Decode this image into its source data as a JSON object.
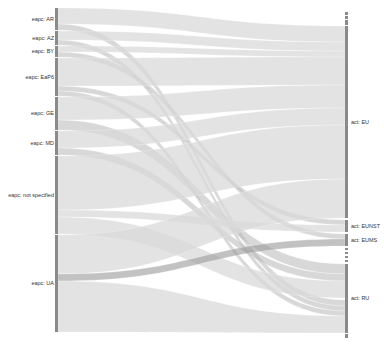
{
  "chart_data": {
    "type": "sankey",
    "title": "",
    "left_axis": {
      "x": 55,
      "width": 3
    },
    "right_axis": {
      "x": 345,
      "width": 3
    },
    "colors": {
      "node_bar": "#8a8a8a",
      "flow_light": "#d9d9d9",
      "flow_mid": "#b8b8b8",
      "flow_dark": "#9a9a9a",
      "background": "#ffffff",
      "label": "#333333"
    },
    "left_nodes": [
      {
        "label": "eapc: AR",
        "y0": 8,
        "y1": 30
      },
      {
        "label": "eapc: AZ",
        "y0": 31,
        "y1": 45
      },
      {
        "label": "eapc: BY",
        "y0": 46,
        "y1": 57
      },
      {
        "label": "eapc: EaP6",
        "y0": 58,
        "y1": 96
      },
      {
        "label": "eapc: GE",
        "y0": 97,
        "y1": 130
      },
      {
        "label": "eapc: MD",
        "y0": 131,
        "y1": 155
      },
      {
        "label": "eapc: not specified",
        "y0": 156,
        "y1": 234
      },
      {
        "label": "eapc: UA",
        "y0": 235,
        "y1": 332
      }
    ],
    "right_nodes": [
      {
        "label": "",
        "y0": 12,
        "y1": 15
      },
      {
        "label": "",
        "y0": 16,
        "y1": 19
      },
      {
        "label": "",
        "y0": 20,
        "y1": 25
      },
      {
        "label": "act: EU",
        "y0": 26,
        "y1": 218
      },
      {
        "label": "act: EUNST",
        "y0": 220,
        "y1": 232
      },
      {
        "label": "act: EUMS",
        "y0": 234,
        "y1": 246
      },
      {
        "label": "",
        "y0": 248,
        "y1": 250
      },
      {
        "label": "",
        "y0": 252,
        "y1": 254
      },
      {
        "label": "",
        "y0": 256,
        "y1": 258
      },
      {
        "label": "",
        "y0": 260,
        "y1": 262
      },
      {
        "label": "act: RU",
        "y0": 264,
        "y1": 333
      },
      {
        "label": "",
        "y0": 334,
        "y1": 338
      }
    ],
    "flows": [
      {
        "from": "eapc: AR",
        "to": "act: EU",
        "sy0": 8,
        "sy1": 24,
        "ty0": 26,
        "ty1": 42,
        "shade": "light"
      },
      {
        "from": "eapc: AR",
        "to": "act: RU",
        "sy0": 24,
        "sy1": 30,
        "ty0": 300,
        "ty1": 306,
        "shade": "mid"
      },
      {
        "from": "eapc: AZ",
        "to": "act: EU",
        "sy0": 31,
        "sy1": 40,
        "ty0": 42,
        "ty1": 51,
        "shade": "light"
      },
      {
        "from": "eapc: AZ",
        "to": "act: RU",
        "sy0": 40,
        "sy1": 45,
        "ty0": 306,
        "ty1": 311,
        "shade": "mid"
      },
      {
        "from": "eapc: BY",
        "to": "act: EU",
        "sy0": 46,
        "sy1": 52,
        "ty0": 51,
        "ty1": 57,
        "shade": "light"
      },
      {
        "from": "eapc: BY",
        "to": "act: EUMS",
        "sy0": 52,
        "sy1": 57,
        "ty0": 234,
        "ty1": 239,
        "shade": "mid"
      },
      {
        "from": "eapc: EaP6",
        "to": "act: EU",
        "sy0": 58,
        "sy1": 86,
        "ty0": 57,
        "ty1": 85,
        "shade": "light"
      },
      {
        "from": "eapc: EaP6",
        "to": "act: EUNST",
        "sy0": 86,
        "sy1": 91,
        "ty0": 220,
        "ty1": 225,
        "shade": "mid"
      },
      {
        "from": "eapc: EaP6",
        "to": "act: RU",
        "sy0": 91,
        "sy1": 96,
        "ty0": 311,
        "ty1": 316,
        "shade": "mid"
      },
      {
        "from": "eapc: GE",
        "to": "act: EU",
        "sy0": 97,
        "sy1": 120,
        "ty0": 85,
        "ty1": 108,
        "shade": "light"
      },
      {
        "from": "eapc: GE",
        "to": "act: RU",
        "sy0": 120,
        "sy1": 130,
        "ty0": 264,
        "ty1": 274,
        "shade": "mid"
      },
      {
        "from": "eapc: MD",
        "to": "act: EU",
        "sy0": 131,
        "sy1": 148,
        "ty0": 108,
        "ty1": 125,
        "shade": "light"
      },
      {
        "from": "eapc: MD",
        "to": "act: RU",
        "sy0": 148,
        "sy1": 155,
        "ty0": 274,
        "ty1": 281,
        "shade": "mid"
      },
      {
        "from": "eapc: not specified",
        "to": "act: EU",
        "sy0": 156,
        "sy1": 210,
        "ty0": 125,
        "ty1": 179,
        "shade": "light"
      },
      {
        "from": "eapc: not specified",
        "to": "act: EUNST",
        "sy0": 210,
        "sy1": 217,
        "ty0": 225,
        "ty1": 232,
        "shade": "light"
      },
      {
        "from": "eapc: not specified",
        "to": "act: RU",
        "sy0": 217,
        "sy1": 234,
        "ty0": 281,
        "ty1": 298,
        "shade": "light"
      },
      {
        "from": "eapc: UA",
        "to": "act: EU",
        "sy0": 235,
        "sy1": 274,
        "ty0": 179,
        "ty1": 218,
        "shade": "light"
      },
      {
        "from": "eapc: UA",
        "to": "act: EUMS",
        "sy0": 274,
        "sy1": 281,
        "ty0": 239,
        "ty1": 246,
        "shade": "dark"
      },
      {
        "from": "eapc: UA",
        "to": "act: RU",
        "sy0": 281,
        "sy1": 332,
        "ty0": 316,
        "ty1": 333,
        "shade": "light"
      }
    ]
  }
}
